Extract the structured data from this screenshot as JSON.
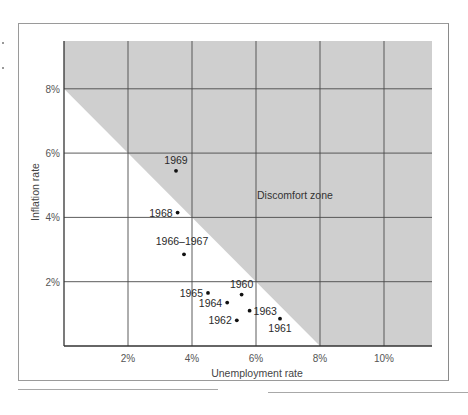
{
  "chart_data": {
    "type": "scatter",
    "title": "",
    "xlabel": "Unemployment rate",
    "ylabel": "Inflation rate",
    "xlim": [
      0,
      11.5
    ],
    "ylim": [
      0,
      9.5
    ],
    "x_ticks": [
      "2%",
      "4%",
      "6%",
      "8%",
      "10%"
    ],
    "x_tick_values": [
      2,
      4,
      6,
      8,
      10
    ],
    "y_ticks": [
      "2%",
      "4%",
      "6%",
      "8%"
    ],
    "y_tick_values": [
      2,
      4,
      6,
      8
    ],
    "grid": true,
    "legend": null,
    "shaded_region": {
      "label": "Discomfort zone",
      "description": "Region where unemployment rate + inflation rate > 8%",
      "boundary": [
        [
          0,
          8
        ],
        [
          8,
          0
        ]
      ],
      "color": "#cfcfcf"
    },
    "points": [
      {
        "label": "1960",
        "x": 5.55,
        "y": 1.6
      },
      {
        "label": "1961",
        "x": 6.75,
        "y": 0.85
      },
      {
        "label": "1962",
        "x": 5.4,
        "y": 0.8
      },
      {
        "label": "1963",
        "x": 5.8,
        "y": 1.1
      },
      {
        "label": "1964",
        "x": 5.1,
        "y": 1.35
      },
      {
        "label": "1965",
        "x": 4.5,
        "y": 1.65
      },
      {
        "label": "1966-1967",
        "x": 3.75,
        "y": 2.85
      },
      {
        "label": "1968",
        "x": 3.55,
        "y": 4.15
      },
      {
        "label": "1969",
        "x": 3.5,
        "y": 5.45
      }
    ],
    "series": [
      {
        "name": "US 1960-1969",
        "x": [
          5.55,
          6.75,
          5.4,
          5.8,
          5.1,
          4.5,
          3.75,
          3.55,
          3.5
        ],
        "y": [
          1.6,
          0.85,
          0.8,
          1.1,
          1.35,
          1.65,
          2.85,
          4.15,
          5.45
        ]
      }
    ],
    "annotations": [
      "Discomfort zone"
    ]
  }
}
